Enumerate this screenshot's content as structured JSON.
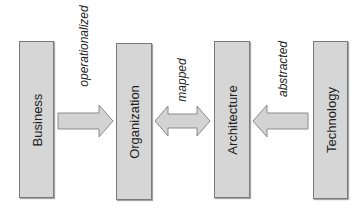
{
  "diagram": {
    "boxes": [
      {
        "id": "business",
        "label": "Business"
      },
      {
        "id": "organization",
        "label": "Organization"
      },
      {
        "id": "architecture",
        "label": "Architecture"
      },
      {
        "id": "technology",
        "label": "Technology"
      }
    ],
    "edges": [
      {
        "from": "business",
        "to": "organization",
        "label": "operationalized",
        "direction": "right"
      },
      {
        "from": "organization",
        "to": "architecture",
        "label": "mapped",
        "direction": "both"
      },
      {
        "from": "technology",
        "to": "architecture",
        "label": "abstracted",
        "direction": "left"
      }
    ],
    "colors": {
      "box_fill": "#d6d6d6",
      "box_border": "#7a7a7a",
      "arrow_fill": "#d3d3d3",
      "arrow_stroke": "#8a8a8a"
    }
  }
}
